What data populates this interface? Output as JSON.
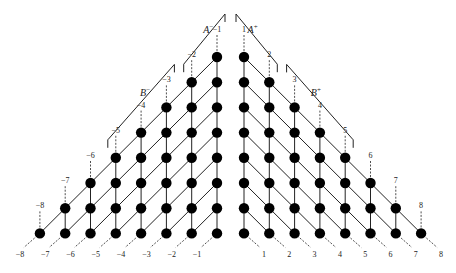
{
  "figure": {
    "node_color": "#000000",
    "line_color": "#222222",
    "node_radius": 5.2,
    "columns": 8,
    "top_labels_left": [
      "−1",
      "−2",
      "−3",
      "−4",
      "−5",
      "−6",
      "−7",
      "−8"
    ],
    "top_labels_right": [
      "1",
      "2",
      "3",
      "4",
      "5",
      "6",
      "7",
      "8"
    ],
    "bottom_labels_left": [
      "−1",
      "−2",
      "−3",
      "−4",
      "−5",
      "−6",
      "−7",
      "−8"
    ],
    "bottom_labels_right": [
      "1",
      "2",
      "3",
      "4",
      "5",
      "6",
      "7",
      "8"
    ],
    "brackets": [
      {
        "name": "A-minus",
        "label": "A",
        "sup": "−",
        "side": "left",
        "from_col": 1,
        "to_col": 2
      },
      {
        "name": "B-minus",
        "label": "B",
        "sup": "−",
        "side": "left",
        "from_col": 3,
        "to_col": 5
      },
      {
        "name": "A-plus",
        "label": "A",
        "sup": "+",
        "side": "right",
        "from_col": 1,
        "to_col": 2
      },
      {
        "name": "B-plus",
        "label": "B",
        "sup": "+",
        "side": "right",
        "from_col": 3,
        "to_col": 5
      }
    ]
  }
}
